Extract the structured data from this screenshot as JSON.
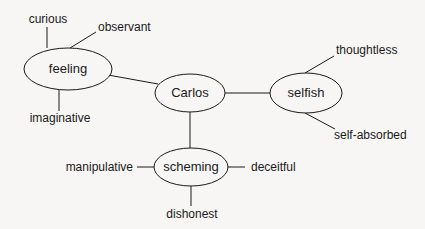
{
  "diagram": {
    "type": "mind-map",
    "center": {
      "id": "carlos",
      "label": "Carlos"
    },
    "nodes": [
      {
        "id": "carlos",
        "label": "Carlos",
        "cx": 190,
        "cy": 93,
        "rx": 35,
        "ry": 19
      },
      {
        "id": "feeling",
        "label": "feeling",
        "cx": 68,
        "cy": 69,
        "rx": 44,
        "ry": 21
      },
      {
        "id": "selfish",
        "label": "selfish",
        "cx": 306,
        "cy": 93,
        "rx": 36,
        "ry": 20
      },
      {
        "id": "scheming",
        "label": "scheming",
        "cx": 191,
        "cy": 167,
        "rx": 37,
        "ry": 19
      }
    ],
    "leaves": [
      {
        "id": "curious",
        "label": "curious",
        "parent": "feeling"
      },
      {
        "id": "observant",
        "label": "observant",
        "parent": "feeling"
      },
      {
        "id": "imaginative",
        "label": "imaginative",
        "parent": "feeling"
      },
      {
        "id": "thoughtless",
        "label": "thoughtless",
        "parent": "selfish"
      },
      {
        "id": "self-absorbed",
        "label": "self-absorbed",
        "parent": "selfish"
      },
      {
        "id": "manipulative",
        "label": "manipulative",
        "parent": "scheming"
      },
      {
        "id": "deceitful",
        "label": "deceitful",
        "parent": "scheming"
      },
      {
        "id": "dishonest",
        "label": "dishonest",
        "parent": "scheming"
      }
    ],
    "edges": [
      [
        "carlos",
        "feeling"
      ],
      [
        "carlos",
        "selfish"
      ],
      [
        "carlos",
        "scheming"
      ],
      [
        "feeling",
        "curious"
      ],
      [
        "feeling",
        "observant"
      ],
      [
        "feeling",
        "imaginative"
      ],
      [
        "selfish",
        "thoughtless"
      ],
      [
        "selfish",
        "self-absorbed"
      ],
      [
        "scheming",
        "manipulative"
      ],
      [
        "scheming",
        "deceitful"
      ],
      [
        "scheming",
        "dishonest"
      ]
    ],
    "colors": {
      "stroke": "#1a1a1a",
      "background": "#f7f6f4",
      "node_fill": "#f7f6f4"
    }
  },
  "labels": {
    "carlos": "Carlos",
    "feeling": "feeling",
    "selfish": "selfish",
    "scheming": "scheming",
    "curious": "curious",
    "observant": "observant",
    "imaginative": "imaginative",
    "thoughtless": "thoughtless",
    "self_absorbed": "self-absorbed",
    "manipulative": "manipulative",
    "deceitful": "deceitful",
    "dishonest": "dishonest"
  }
}
